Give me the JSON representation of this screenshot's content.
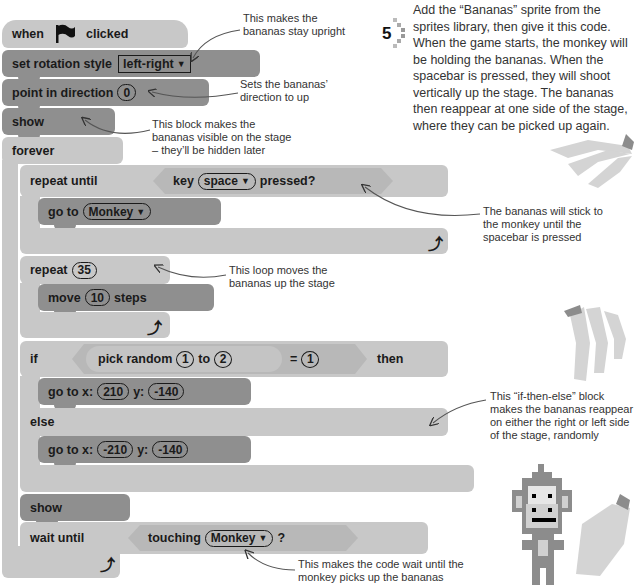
{
  "step": {
    "number": "5",
    "text": "Add the “Bananas” sprite from the sprites library, then give it this code. When the game starts, the monkey will be holding the bananas. When the spacebar is pressed, they will shoot vertically up the stage. The bananas then reappear at one side of the stage, where they can be picked up again."
  },
  "script": {
    "hat": {
      "when": "when",
      "clicked": "clicked",
      "icon": "green-flag-icon"
    },
    "set_rotation": {
      "label": "set rotation style",
      "value": "left-right"
    },
    "point_dir": {
      "label": "point in direction",
      "value": "0"
    },
    "show1": "show",
    "forever": "forever",
    "repeat_until": {
      "label": "repeat until",
      "cond_key": "key",
      "cond_value": "space",
      "cond_end": "pressed?"
    },
    "go_to_monkey": {
      "label": "go to",
      "value": "Monkey"
    },
    "repeat": {
      "label": "repeat",
      "value": "35"
    },
    "move": {
      "label": "move",
      "value": "10",
      "suffix": "steps"
    },
    "if_block": {
      "if": "if",
      "pick": "pick random",
      "from": "1",
      "to": "to",
      "to_value": "2",
      "equals": "=",
      "eq_value": "1",
      "then": "then",
      "else": "else"
    },
    "goto_xy_1": {
      "label": "go to x:",
      "x": "210",
      "ylabel": "y:",
      "y": "-140"
    },
    "goto_xy_2": {
      "label": "go to x:",
      "x": "-210",
      "ylabel": "y:",
      "y": "-140"
    },
    "show2": "show",
    "wait_until": {
      "label": "wait until",
      "cond": "touching",
      "cond_value": "Monkey",
      "cond_end": "?"
    },
    "loop_arrow": "⤴"
  },
  "annotations": {
    "upright": "This makes the bananas stay upright",
    "direction": "Sets the bananas’ direction to up",
    "visible": "This block makes the bananas visible on the stage – they’ll be hidden later",
    "stick": "The bananas will stick to the monkey until the spacebar is pressed",
    "loop": "This loop moves the bananas up the stage",
    "ifelse": "This “if-then-else” block makes the bananas reappear on either the right or left side of the stage, randomly",
    "wait": "This makes the code wait until the monkey picks up the bananas"
  },
  "colors": {
    "dark_block": "#8f8f8f",
    "light_block": "#c8c8c8",
    "hex": "#b8b8b8",
    "text": "#1a1a1a"
  }
}
